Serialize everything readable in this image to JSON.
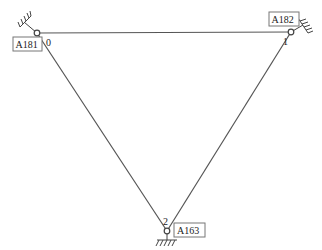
{
  "diagram": {
    "type": "structural-truss",
    "colors": {
      "line": "#555555",
      "node": "#444444",
      "label_border": "#777777",
      "text": "#222222",
      "background": "#ffffff"
    },
    "nodes": [
      {
        "id": "0",
        "index_label": "0",
        "tag": "A181",
        "x": 37,
        "y": 33,
        "support": "fixed-upper-left"
      },
      {
        "id": "1",
        "index_label": "1",
        "tag": "A182",
        "x": 291,
        "y": 32,
        "support": "fixed-right"
      },
      {
        "id": "2",
        "index_label": "2",
        "tag": "A163",
        "x": 167,
        "y": 231,
        "support": "fixed-bottom"
      }
    ],
    "edges": [
      {
        "from": "0",
        "to": "1"
      },
      {
        "from": "1",
        "to": "2"
      },
      {
        "from": "2",
        "to": "0"
      }
    ]
  }
}
